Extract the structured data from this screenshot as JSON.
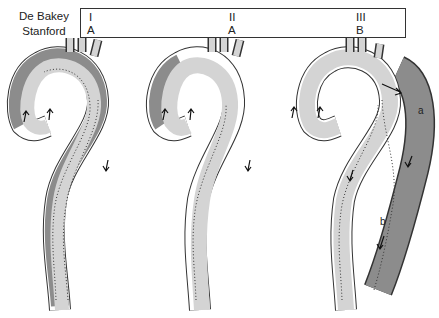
{
  "header": {
    "row_labels": [
      "De Bakey",
      "Stanford"
    ],
    "columns": [
      {
        "debakey": "I",
        "stanford": "A"
      },
      {
        "debakey": "II",
        "stanford": "A"
      },
      {
        "debakey": "III",
        "stanford": "B"
      }
    ]
  },
  "diagrams": [
    {
      "name": "De Bakey I / Stanford A",
      "dissection_extent": "ascending aorta through arch and descending aorta"
    },
    {
      "name": "De Bakey II / Stanford A",
      "dissection_extent": "ascending aorta only"
    },
    {
      "name": "De Bakey III / Stanford B",
      "dissection_extent": "descending aorta distal to left subclavian",
      "sublabels": [
        "a",
        "b"
      ]
    }
  ],
  "colors": {
    "lumen": "#d4d4d4",
    "false_lumen": "#8c8c8c",
    "wall": "#ffffff",
    "outline": "#333333"
  }
}
